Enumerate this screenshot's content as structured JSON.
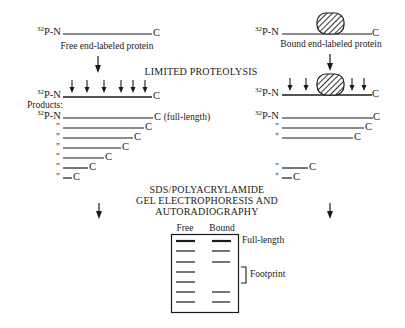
{
  "label_prefix": {
    "isotope": "32",
    "nterm": "P-N",
    "cterm": "C"
  },
  "free": {
    "caption": "Free end-labeled protein",
    "products_label": "Products:",
    "full_length_note": "(full-length)",
    "ditto_mark": "\"",
    "cut_sites_count": 6,
    "product_count": 7
  },
  "bound": {
    "caption": "Bound end-labeled protein",
    "ditto_mark": "\"",
    "cut_sites_count": 4,
    "product_count": 5
  },
  "step1": {
    "text": "LIMITED PROTEOLYSIS"
  },
  "step2": {
    "line1": "SDS/POLYACRYLAMIDE",
    "line2": "GEL ELECTROPHORESIS AND",
    "line3": "AUTORADIOGRAPHY"
  },
  "gel": {
    "lanes": [
      "Free",
      "Bound"
    ],
    "full_length_label": "Full-length",
    "footprint_label": "Footprint",
    "free_bands": 7,
    "bound_bands": 5
  }
}
